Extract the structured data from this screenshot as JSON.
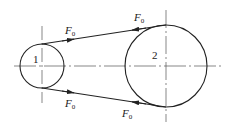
{
  "diagram": {
    "pulleys": [
      {
        "id": "1",
        "label": "1",
        "cx": 42,
        "cy": 66,
        "r": 22
      },
      {
        "id": "2",
        "label": "2",
        "cx": 166,
        "cy": 66,
        "r": 41
      }
    ],
    "forces": [
      {
        "symbol": "F",
        "subscript": "0",
        "position": "top-left"
      },
      {
        "symbol": "F",
        "subscript": "0",
        "position": "top-right"
      },
      {
        "symbol": "F",
        "subscript": "0",
        "position": "bottom-left"
      },
      {
        "symbol": "F",
        "subscript": "0",
        "position": "bottom-right"
      }
    ],
    "colors": {
      "line": "#222222",
      "centerline": "#555555",
      "background": "#ffffff"
    }
  }
}
